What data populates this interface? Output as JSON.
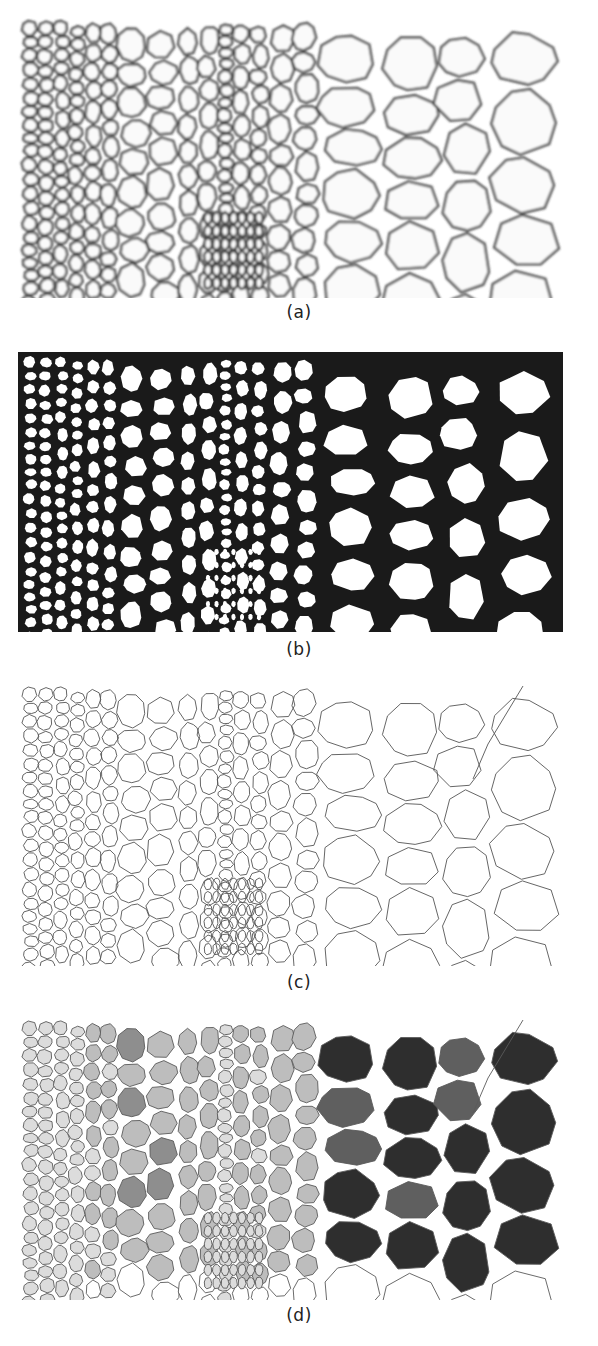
{
  "figure": {
    "panels": [
      {
        "id": "a",
        "label": "(a)",
        "description": "Original micrograph of plant tissue cross-section (grayscale cells)",
        "style": "grayscale-photo"
      },
      {
        "id": "b",
        "label": "(b)",
        "description": "Binarized (thresholded) image — thick black cell walls",
        "style": "binary"
      },
      {
        "id": "c",
        "label": "(c)",
        "description": "Skeletonized cell boundaries — thin line network",
        "style": "skeleton"
      },
      {
        "id": "d",
        "label": "(d)",
        "description": "Cells shaded by size class — light gray (small) to near-black (largest)",
        "style": "size-classified"
      }
    ],
    "size_class_colors": [
      "#dcdcdc",
      "#bdbdbd",
      "#8e8e8e",
      "#5f5f5f",
      "#2e2e2e"
    ],
    "wall_color": "#1a1a1a",
    "skeleton_color": "#555555"
  }
}
